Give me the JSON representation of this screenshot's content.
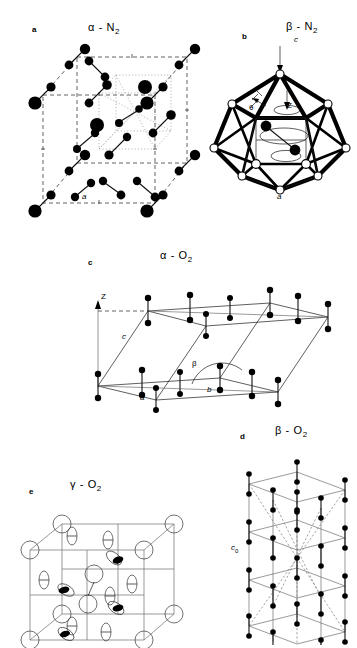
{
  "figure": {
    "header_note": "",
    "panels": [
      {
        "id": "a",
        "letter": "a",
        "title_alpha": "α",
        "title_dash": "-",
        "title_species": "N",
        "title_sub": "2",
        "title_full": "α - N2",
        "structure": "cubic Pa3 unit cell of alpha-nitrogen with N2 dumbbells",
        "labels": [
          {
            "name": "lattice-a",
            "text": "a"
          }
        ]
      },
      {
        "id": "b",
        "letter": "b",
        "title_alpha": "β",
        "title_dash": "-",
        "title_species": "N",
        "title_sub": "2",
        "title_full": "β - N2",
        "structure": "icosahedral coordination cage of beta-nitrogen with precessing N2 molecule",
        "labels": [
          {
            "name": "axis-c",
            "text": "c"
          },
          {
            "name": "axis-z",
            "text": "Z"
          },
          {
            "name": "angle-theta",
            "text": "θ"
          },
          {
            "name": "lattice-a",
            "text": "a"
          }
        ]
      },
      {
        "id": "c",
        "letter": "c",
        "title_alpha": "α",
        "title_dash": "-",
        "title_species": "O",
        "title_sub": "2",
        "title_full": "α - O2",
        "structure": "monoclinic unit cell of alpha-oxygen with O2 molecules aligned along Z",
        "labels": [
          {
            "name": "axis-z",
            "text": "Z"
          },
          {
            "name": "lattice-c",
            "text": "c"
          },
          {
            "name": "lattice-a",
            "text": "a"
          },
          {
            "name": "lattice-b",
            "text": "b"
          },
          {
            "name": "angle-beta",
            "text": "β"
          }
        ]
      },
      {
        "id": "d",
        "letter": "d",
        "title_alpha": "β",
        "title_dash": "-",
        "title_species": "O",
        "title_sub": "2",
        "title_full": "β - O2",
        "structure": "rhombohedral cell of beta-oxygen, hexagonal setting with stacked layers",
        "labels": [
          {
            "name": "lattice-c0",
            "text": "c",
            "sub": "0"
          }
        ]
      },
      {
        "id": "e",
        "letter": "e",
        "title_alpha": "γ",
        "title_dash": "-",
        "title_species": "O",
        "title_sub": "2",
        "title_full": "γ - O2",
        "structure": "cubic cell of gamma-oxygen with spherically disordered and disc-disordered O2 molecules",
        "labels": []
      }
    ]
  },
  "colors": {
    "ink": "#000000",
    "paper": "#ffffff",
    "grey_line": "#6e6e6e",
    "dashed_line": "#3a3a3a"
  }
}
